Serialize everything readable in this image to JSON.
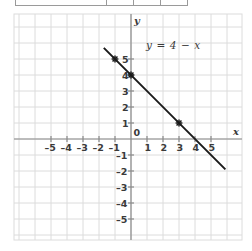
{
  "table_fragment": {
    "present": true,
    "description": "cropped-table-bottom-row",
    "cells": [
      "",
      "",
      "",
      ""
    ]
  },
  "chart_data": {
    "type": "line",
    "title": "",
    "xlabel": "x",
    "ylabel": "y",
    "equation": "y = 4 − x",
    "slope": -1,
    "intercept": 4,
    "grid": true,
    "legend_position": "inline-annotation",
    "xlim": [
      -5.8,
      5.8
    ],
    "ylim": [
      -5.8,
      5.8
    ],
    "xticks": [
      -5,
      -4,
      -3,
      -2,
      -1,
      0,
      1,
      2,
      3,
      4,
      5
    ],
    "yticks": [
      -5,
      -4,
      -3,
      -2,
      -1,
      0,
      1,
      2,
      3,
      4,
      5
    ],
    "xticklabels": [
      "–5",
      "–4",
      "–3",
      "–2",
      "–1",
      "0",
      "1",
      "2",
      "3",
      "4",
      "5"
    ],
    "yticklabels": [
      "–5",
      "–4",
      "–3",
      "–2",
      "–1",
      "0",
      "1",
      "2",
      "3",
      "4",
      "5"
    ],
    "series": [
      {
        "name": "y = 4 − x",
        "line_start": [
          -1.7,
          5.7
        ],
        "line_end": [
          5.9,
          -1.9
        ],
        "marked_points": [
          {
            "x": -1,
            "y": 5
          },
          {
            "x": 0,
            "y": 4
          },
          {
            "x": 3,
            "y": 1
          }
        ]
      }
    ],
    "colors": {
      "grid": "#dcdcdc",
      "axis": "#8a8a8a",
      "line": "#1a1a1a",
      "text": "#3a3a3a",
      "background": "#ffffff"
    }
  },
  "axis_labels": {
    "x_axis_name": "x",
    "y_axis_name": "y",
    "origin_label": "0"
  }
}
